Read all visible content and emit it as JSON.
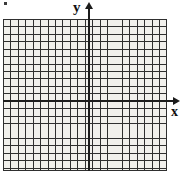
{
  "figure": {
    "type": "coordinate-grid",
    "width": 184,
    "height": 177
  },
  "axes": {
    "y_label": "y",
    "x_label": "x",
    "y_axis": {
      "orientation": "vertical",
      "position_x": 88,
      "top": 9,
      "bottom": 171,
      "arrow": "up"
    },
    "x_axis": {
      "orientation": "horizontal",
      "position_y": 100,
      "left": 3,
      "right": 173,
      "arrow": "right"
    }
  },
  "grid": {
    "left": 3,
    "top": 19,
    "width": 164,
    "height": 152,
    "cell_size": 7.45,
    "columns": 22,
    "rows": 20,
    "columns_left_of_y_axis": 11,
    "columns_right_of_y_axis": 11,
    "rows_above_x_axis": 11,
    "rows_below_x_axis": 9,
    "tick_labels": [],
    "show_numbers": false
  },
  "colors": {
    "background": "#ffffff",
    "grid_fill": "#f1f0ec",
    "grid_line": "#2f2f2f",
    "axis_line": "#1c1c1c",
    "label_text": "#111111",
    "corner_mark": "#3a3a3a"
  },
  "marks": {
    "corner_dot": {
      "name": "scan-artifact-dot",
      "x": 4,
      "y": 2,
      "width": 3,
      "height": 3
    }
  },
  "chart_data": {
    "type": "scatter",
    "title": "",
    "subtitle": "",
    "xlabel": "x",
    "ylabel": "y",
    "series": [],
    "x": [],
    "values": [],
    "xlim": [
      -11,
      11
    ],
    "ylim": [
      -9,
      11
    ],
    "grid": true,
    "legend": "none",
    "annotations": [],
    "note": "Empty graph paper: no plotted data points, curves, or tick numbers are rendered."
  }
}
